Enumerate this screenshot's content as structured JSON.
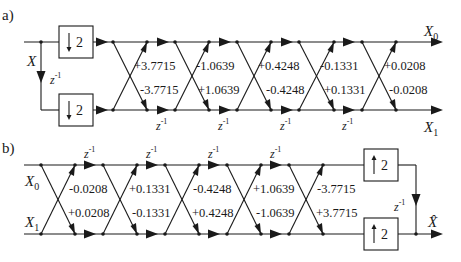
{
  "diagram": {
    "part_a": {
      "label": "a)",
      "input": "X",
      "outputs": [
        {
          "base": "X",
          "sub": "0"
        },
        {
          "base": "X",
          "sub": "1"
        }
      ],
      "delay_label": {
        "base": "z",
        "exp": "-1"
      },
      "downsample_factor": "2",
      "top_coefficients": [
        "+3.7715",
        "-1.0639",
        "+0.4248",
        "-0.1331",
        "+0.0208"
      ],
      "bottom_coefficients": [
        "-3.7715",
        "+1.0639",
        "-0.4248",
        "+0.1331",
        "-0.0208"
      ]
    },
    "part_b": {
      "label": "b)",
      "inputs": [
        {
          "base": "X",
          "sub": "0"
        },
        {
          "base": "X",
          "sub": "1"
        }
      ],
      "output": "X̂",
      "delay_label": {
        "base": "z",
        "exp": "-1"
      },
      "upsample_factor": "2",
      "top_coefficients": [
        "-0.0208",
        "+0.1331",
        "-0.4248",
        "+1.0639",
        "-3.7715"
      ],
      "bottom_coefficients": [
        "+0.0208",
        "-0.1331",
        "+0.4248",
        "-1.0639",
        "+3.7715"
      ]
    }
  }
}
